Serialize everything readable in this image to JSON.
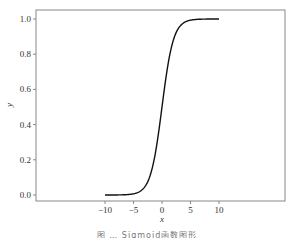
{
  "chart_data": {
    "type": "line",
    "title": "",
    "caption": "图 … Sigmoid函数图形",
    "xlabel": "x",
    "ylabel": "y",
    "xlim": [
      -10.8,
      10.8
    ],
    "ylim": [
      -0.03,
      1.05
    ],
    "grid": false,
    "legend": null,
    "xticks": [
      -10,
      -5,
      0,
      5,
      10
    ],
    "xtick_labels": [
      "−10",
      "−5",
      "0",
      "5",
      "10"
    ],
    "yticks": [
      0.0,
      0.2,
      0.4,
      0.6,
      0.8,
      1.0
    ],
    "ytick_labels": [
      "0.0",
      "0.2",
      "0.4",
      "0.6",
      "0.8",
      "1.0"
    ],
    "series": [
      {
        "name": "sigmoid",
        "function": "1/(1+exp(-x))",
        "color": "#111111",
        "x": [
          -10,
          -8,
          -6,
          -5,
          -4,
          -3,
          -2,
          -1,
          0,
          1,
          2,
          3,
          4,
          5,
          6,
          8,
          10
        ],
        "y": [
          0.0,
          0.0003,
          0.0025,
          0.0067,
          0.018,
          0.047,
          0.119,
          0.269,
          0.5,
          0.731,
          0.881,
          0.953,
          0.982,
          0.993,
          0.9975,
          0.9997,
          1.0
        ]
      }
    ]
  },
  "layout": {
    "plot_box": {
      "left": 36,
      "top": 10,
      "right": 285,
      "bottom": 201
    },
    "line_color": "#111111",
    "frame_color": "#888888"
  }
}
